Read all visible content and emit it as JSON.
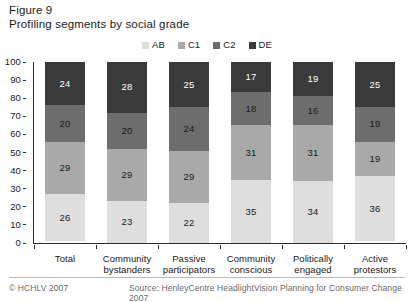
{
  "figure": {
    "label": "Figure 9",
    "title": "Profiling segments by social grade"
  },
  "legend": {
    "position": "top-center",
    "items": [
      {
        "label": "AB",
        "color": "#dedede"
      },
      {
        "label": "C1",
        "color": "#a9a9a9"
      },
      {
        "label": "C2",
        "color": "#6d6d6d"
      },
      {
        "label": "DE",
        "color": "#3a3a3a"
      }
    ]
  },
  "axis": {
    "y_ticks": [
      "100",
      "90",
      "80",
      "70",
      "60",
      "50",
      "40",
      "30",
      "20",
      "10",
      "0"
    ]
  },
  "footer": {
    "copyright": "© HCHLV 2007",
    "source": "Source: HenleyCentre HeadlightVision Planning for Consumer Change 2007"
  },
  "chart_data": {
    "type": "bar",
    "stacked": true,
    "title": "Profiling segments by social grade",
    "xlabel": "",
    "ylabel": "",
    "ylim": [
      0,
      100
    ],
    "yticks": [
      0,
      10,
      20,
      30,
      40,
      50,
      60,
      70,
      80,
      90,
      100
    ],
    "grid": false,
    "legend_position": "top-center",
    "categories": [
      "Total",
      "Community bystanders",
      "Passive participators",
      "Community conscious",
      "Politically engaged",
      "Active protestors"
    ],
    "category_lines": [
      [
        "Total"
      ],
      [
        "Community",
        "bystanders"
      ],
      [
        "Passive",
        "participators"
      ],
      [
        "Community",
        "conscious"
      ],
      [
        "Politically",
        "engaged"
      ],
      [
        "Active",
        "protestors"
      ]
    ],
    "series": [
      {
        "name": "AB",
        "color": "#dedede",
        "text_color": "#1a1a1a",
        "values": [
          26,
          23,
          22,
          35,
          34,
          36
        ]
      },
      {
        "name": "C1",
        "color": "#a9a9a9",
        "text_color": "#1a1a1a",
        "values": [
          29,
          29,
          29,
          31,
          31,
          19
        ]
      },
      {
        "name": "C2",
        "color": "#6d6d6d",
        "text_color": "#1a1a1a",
        "values": [
          20,
          20,
          24,
          18,
          16,
          19
        ]
      },
      {
        "name": "DE",
        "color": "#3a3a3a",
        "text_color": "#ffffff",
        "values": [
          24,
          28,
          25,
          17,
          19,
          25
        ]
      }
    ]
  }
}
